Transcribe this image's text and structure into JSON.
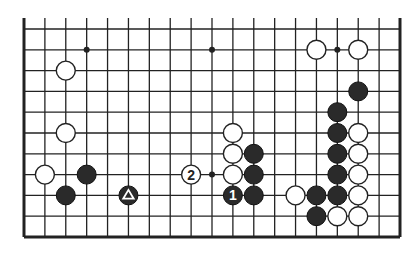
{
  "diagram": {
    "type": "go-board-partial",
    "columns": 19,
    "rows_shown": 11,
    "edges": [
      "left",
      "right",
      "bottom"
    ],
    "colors": {
      "black": "#2a2a2a",
      "white": "#ffffff",
      "line": "#222222",
      "background": "#ffffff"
    }
  },
  "star_points": [
    {
      "col": 3,
      "row": 1
    },
    {
      "col": 9,
      "row": 1
    },
    {
      "col": 15,
      "row": 1
    },
    {
      "col": 9,
      "row": 7
    }
  ],
  "stones": [
    {
      "color": "white",
      "col": 2,
      "row": 2,
      "label": ""
    },
    {
      "color": "white",
      "col": 2,
      "row": 5,
      "label": ""
    },
    {
      "color": "white",
      "col": 1,
      "row": 7,
      "label": ""
    },
    {
      "color": "black",
      "col": 3,
      "row": 7,
      "label": ""
    },
    {
      "color": "black",
      "col": 2,
      "row": 8,
      "label": ""
    },
    {
      "color": "black",
      "col": 5,
      "row": 8,
      "label": "triangle"
    },
    {
      "color": "white",
      "col": 8,
      "row": 7,
      "label": "2"
    },
    {
      "color": "white",
      "col": 14,
      "row": 1,
      "label": ""
    },
    {
      "color": "white",
      "col": 16,
      "row": 1,
      "label": ""
    },
    {
      "color": "black",
      "col": 16,
      "row": 3,
      "label": ""
    },
    {
      "color": "black",
      "col": 15,
      "row": 4,
      "label": ""
    },
    {
      "color": "black",
      "col": 15,
      "row": 5,
      "label": ""
    },
    {
      "color": "white",
      "col": 16,
      "row": 5,
      "label": ""
    },
    {
      "color": "black",
      "col": 15,
      "row": 6,
      "label": ""
    },
    {
      "color": "white",
      "col": 16,
      "row": 6,
      "label": ""
    },
    {
      "color": "black",
      "col": 15,
      "row": 7,
      "label": ""
    },
    {
      "color": "white",
      "col": 16,
      "row": 7,
      "label": ""
    },
    {
      "color": "white",
      "col": 10,
      "row": 5,
      "label": ""
    },
    {
      "color": "white",
      "col": 10,
      "row": 6,
      "label": ""
    },
    {
      "color": "black",
      "col": 11,
      "row": 6,
      "label": ""
    },
    {
      "color": "white",
      "col": 10,
      "row": 7,
      "label": ""
    },
    {
      "color": "black",
      "col": 11,
      "row": 7,
      "label": ""
    },
    {
      "color": "black",
      "col": 10,
      "row": 8,
      "label": "1"
    },
    {
      "color": "black",
      "col": 11,
      "row": 8,
      "label": ""
    },
    {
      "color": "white",
      "col": 13,
      "row": 8,
      "label": ""
    },
    {
      "color": "black",
      "col": 14,
      "row": 8,
      "label": ""
    },
    {
      "color": "black",
      "col": 15,
      "row": 8,
      "label": ""
    },
    {
      "color": "white",
      "col": 16,
      "row": 8,
      "label": ""
    },
    {
      "color": "black",
      "col": 14,
      "row": 9,
      "label": ""
    },
    {
      "color": "white",
      "col": 15,
      "row": 9,
      "label": ""
    },
    {
      "color": "white",
      "col": 16,
      "row": 9,
      "label": ""
    }
  ],
  "move_labels": {
    "move_1": "1",
    "move_2": "2"
  }
}
